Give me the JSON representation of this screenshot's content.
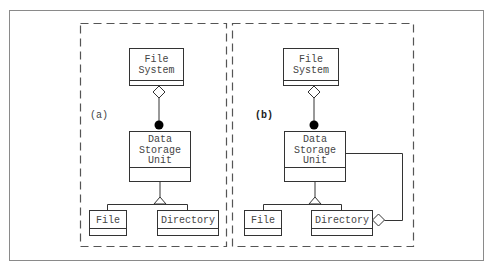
{
  "diagram": {
    "panels": [
      {
        "label": "(a)",
        "label_bold": false,
        "classes": {
          "file_system": [
            "File",
            "System"
          ],
          "data_storage_unit": [
            "Data",
            "Storage",
            "Unit"
          ],
          "file": "File",
          "directory": "Directory"
        },
        "relations": [
          {
            "from": "File System",
            "to": "Data Storage Unit",
            "type": "aggregation (hollow diamond) with filled dot end"
          },
          {
            "from": "File",
            "to": "Data Storage Unit",
            "type": "generalization"
          },
          {
            "from": "Directory",
            "to": "Data Storage Unit",
            "type": "generalization"
          }
        ]
      },
      {
        "label": "(b)",
        "label_bold": true,
        "classes": {
          "file_system": [
            "File",
            "System"
          ],
          "data_storage_unit": [
            "Data",
            "Storage",
            "Unit"
          ],
          "file": "File",
          "directory": "Directory"
        },
        "relations": [
          {
            "from": "File System",
            "to": "Data Storage Unit",
            "type": "aggregation (hollow diamond) with filled dot end"
          },
          {
            "from": "File",
            "to": "Data Storage Unit",
            "type": "generalization"
          },
          {
            "from": "Directory",
            "to": "Data Storage Unit",
            "type": "generalization"
          },
          {
            "from": "Directory",
            "to": "Data Storage Unit",
            "type": "aggregation (hollow diamond at Directory)"
          }
        ]
      }
    ],
    "colors": {
      "line": "#333333",
      "dash": "#555555",
      "frame": "#888888",
      "text": "#444444"
    }
  }
}
